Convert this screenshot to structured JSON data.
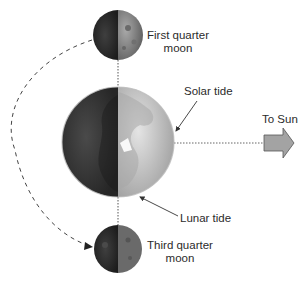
{
  "diagram": {
    "type": "spring-neap tide geometry (neap tide, quarter moons)",
    "labels": {
      "first_quarter_line1": "First quarter",
      "first_quarter_line2": "moon",
      "third_quarter_line1": "Third quarter",
      "third_quarter_line2": "moon",
      "solar_tide": "Solar tide",
      "lunar_tide": "Lunar tide",
      "to_sun": "To Sun"
    },
    "colors": {
      "background": "#ffffff",
      "text": "#2b2b2b",
      "earth_dark": "#3d3d3d",
      "earth_light": "#c8c8c8",
      "moon_dark": "#2e2e2e",
      "moon_light": "#8a8a8a",
      "sun_arrow_fill": "#a3a3a3",
      "sun_arrow_stroke": "#555555",
      "line": "#555555"
    },
    "elements": {
      "earth": {
        "cx": 118,
        "cy": 142,
        "rx": 56,
        "ry": 55
      },
      "first_quarter_moon": {
        "cx": 118,
        "cy": 35,
        "r": 25
      },
      "third_quarter_moon": {
        "cx": 118,
        "cy": 249,
        "r": 24
      }
    }
  }
}
